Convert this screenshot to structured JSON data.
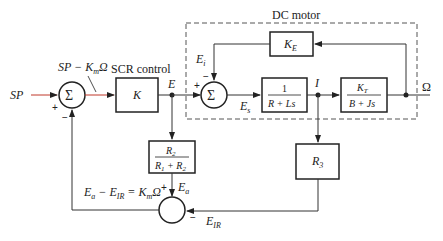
{
  "diagram": {
    "group_label": "DC motor",
    "blocks": {
      "controller_label": "SCR control",
      "controller": "K",
      "back_emf": "K",
      "back_emf_sub": "E",
      "electrical_num": "1",
      "electrical_den": "R + Ls",
      "mech_num": "K",
      "mech_num_sub": "T",
      "mech_den": "B + Js",
      "divider_num": "R",
      "divider_num_sub": "2",
      "divider_den_a": "R",
      "divider_den_a_sub": "1",
      "divider_den_b": " + R",
      "divider_den_b_sub": "2",
      "sense": "R",
      "sense_sub": "3"
    },
    "signals": {
      "input": "SP",
      "error_label": "SP − K",
      "error_label_sub": "m",
      "error_label_tail": "Ω",
      "E": "E",
      "Ei": "E",
      "Ei_sub": "i",
      "Es": "E",
      "Es_sub": "s",
      "I": "I",
      "output": "Ω",
      "Ea": "E",
      "Ea_sub": "a",
      "EIR": "E",
      "EIR_sub": "IR",
      "feedback_eq_a": "E",
      "feedback_eq_a_sub": "a",
      "feedback_eq_b": " − E",
      "feedback_eq_b_sub": "IR",
      "feedback_eq_c": " = K",
      "feedback_eq_c_sub": "m",
      "feedback_eq_d": "Ω"
    },
    "summing_symbol": "Σ",
    "signs": {
      "plus": "+",
      "minus": "−"
    },
    "colors": {
      "line": "#3a3a3a",
      "accent_red": "#c0392b",
      "dash": "#555555"
    }
  }
}
